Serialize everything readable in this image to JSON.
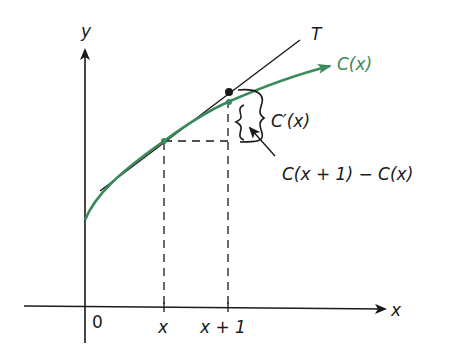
{
  "diagram": {
    "type": "marginal-cost-tangent-approximation",
    "colors": {
      "axis": "#1a1a1a",
      "curve": "#3a8a5c",
      "tangent": "#1a1a1a",
      "dashed": "#1a1a1a"
    },
    "axes": {
      "y_label": "y",
      "x_label": "x",
      "origin_label": "0"
    },
    "ticks": {
      "x_label": "x",
      "x_plus_1_label": "x + 1"
    },
    "curve": {
      "label": "C(x)"
    },
    "tangent": {
      "label": "T"
    },
    "annotations": {
      "derivative_label": "C′(x)",
      "difference_label": "C(x + 1) − C(x)"
    }
  }
}
